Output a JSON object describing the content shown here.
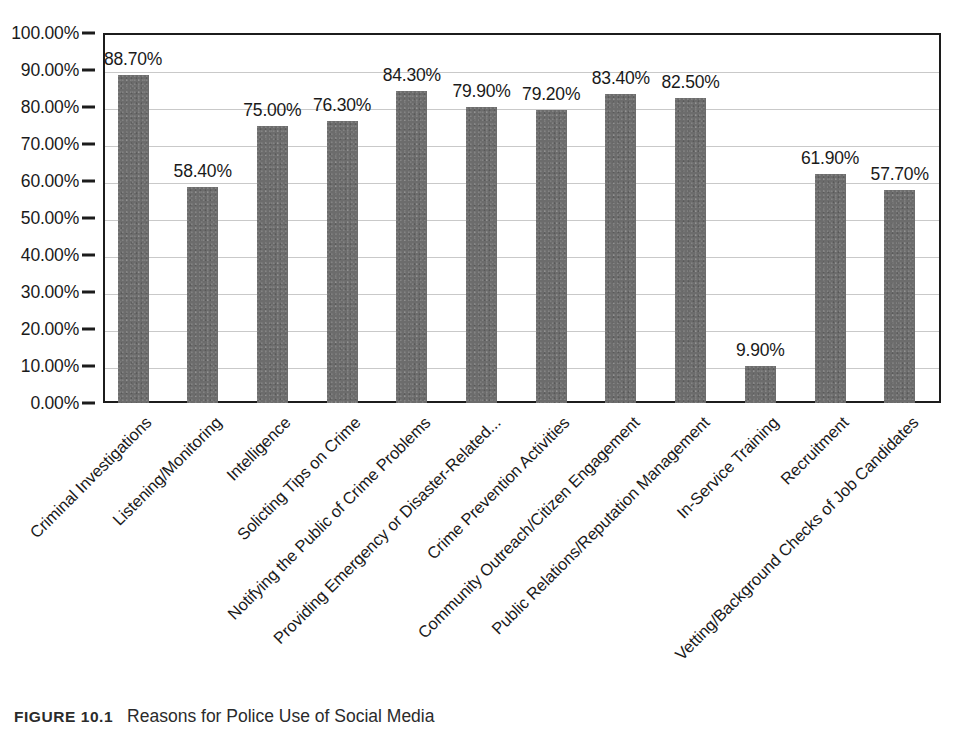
{
  "chart_data": {
    "type": "bar",
    "title": "",
    "xlabel": "",
    "ylabel": "",
    "ylim": [
      0,
      100
    ],
    "ytick_labels": [
      "100.00%",
      "90.00%",
      "80.00%",
      "70.00%",
      "60.00%",
      "50.00%",
      "40.00%",
      "30.00%",
      "20.00%",
      "10.00%",
      "0.00%"
    ],
    "ytick_values": [
      100,
      90,
      80,
      70,
      60,
      50,
      40,
      30,
      20,
      10,
      0
    ],
    "grid": true,
    "legend": "none",
    "bar_color": "#6c6c6c",
    "categories": [
      "Criminal Investigations",
      "Listening/Monitoring",
      "Intelligence",
      "Solicting Tips on Crime",
      "Notifying the Public of Crime Problems",
      "Providing Emergency or Disaster-Related...",
      "Crime Prevention Activities",
      "Community Outreach/Citizen Engagement",
      "Public Relations/Reputation Management",
      "In-Service Training",
      "Recruitment",
      "Vetting/Background Checks of Job Candidates"
    ],
    "values": [
      88.7,
      58.4,
      75.0,
      76.3,
      84.3,
      79.9,
      79.2,
      83.4,
      82.5,
      9.9,
      61.9,
      57.7
    ],
    "value_labels": [
      "88.70%",
      "58.40%",
      "75.00%",
      "76.30%",
      "84.30%",
      "79.90%",
      "79.20%",
      "83.40%",
      "82.50%",
      "9.90%",
      "61.90%",
      "57.70%"
    ]
  },
  "caption": {
    "label": "FIGURE 10.1",
    "text": "Reasons for Police Use of Social Media"
  }
}
